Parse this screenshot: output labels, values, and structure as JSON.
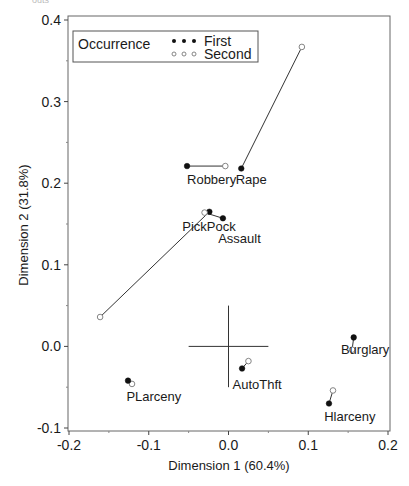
{
  "chart_data": {
    "type": "scatter",
    "title": "",
    "xlabel": "Dimension 1 (60.4%)",
    "ylabel": "Dimension 2 (31.8%)",
    "xlim": [
      -0.2,
      0.2
    ],
    "ylim": [
      -0.1,
      0.4
    ],
    "xticks": [
      -0.2,
      -0.1,
      0.0,
      0.1,
      0.2
    ],
    "xtick_labels": [
      "-0.2",
      "-0.1",
      "0.0",
      "0.1",
      "0.2"
    ],
    "yticks": [
      -0.1,
      0.0,
      0.1,
      0.2,
      0.3,
      0.4
    ],
    "ytick_labels": [
      "-0.1",
      "0.0",
      "0.1",
      "0.2",
      "0.3",
      "0.4"
    ],
    "grid": false,
    "legend": {
      "title": "Occurrence",
      "position": "top-left",
      "entries": [
        {
          "label": "First",
          "marker": "filled-circle"
        },
        {
          "label": "Second",
          "marker": "open-circle"
        }
      ]
    },
    "series": [
      {
        "name": "First",
        "marker": "filled-circle"
      },
      {
        "name": "Second",
        "marker": "open-circle"
      }
    ],
    "points": [
      {
        "label": "Robbery",
        "first": [
          -0.052,
          0.221
        ],
        "second": [
          -0.004,
          0.221
        ],
        "label_pos": [
          -0.052,
          0.199
        ]
      },
      {
        "label": "Rape",
        "first": [
          0.016,
          0.218
        ],
        "second": [
          0.092,
          0.367
        ],
        "label_pos": [
          0.009,
          0.199
        ]
      },
      {
        "label": "PickPock",
        "first": [
          -0.024,
          0.165
        ],
        "second": [
          -0.161,
          0.036
        ],
        "label_pos": [
          -0.058,
          0.142
        ]
      },
      {
        "label": "Assault",
        "first": [
          -0.007,
          0.157
        ],
        "second": [
          -0.03,
          0.164
        ],
        "label_pos": [
          -0.013,
          0.127
        ]
      },
      {
        "label": "Burglary",
        "first": [
          0.157,
          0.011
        ],
        "second": [
          0.155,
          -0.004
        ],
        "label_pos": [
          0.141,
          -0.009
        ]
      },
      {
        "label": "AutoThft",
        "first": [
          0.017,
          -0.027
        ],
        "second": [
          0.025,
          -0.018
        ],
        "label_pos": [
          0.005,
          -0.052
        ]
      },
      {
        "label": "Hlarceny",
        "first": [
          0.126,
          -0.07
        ],
        "second": [
          0.131,
          -0.054
        ],
        "label_pos": [
          0.12,
          -0.092
        ]
      },
      {
        "label": "PLarceny",
        "first": [
          -0.126,
          -0.042
        ],
        "second": [
          -0.121,
          -0.046
        ],
        "label_pos": [
          -0.128,
          -0.067
        ]
      }
    ],
    "reference_cross": {
      "center": [
        0.0,
        0.0
      ],
      "x_extent": [
        -0.05,
        0.05
      ],
      "y_extent": [
        -0.05,
        0.05
      ]
    }
  },
  "figure": {
    "cropped_header_text": "outs"
  }
}
